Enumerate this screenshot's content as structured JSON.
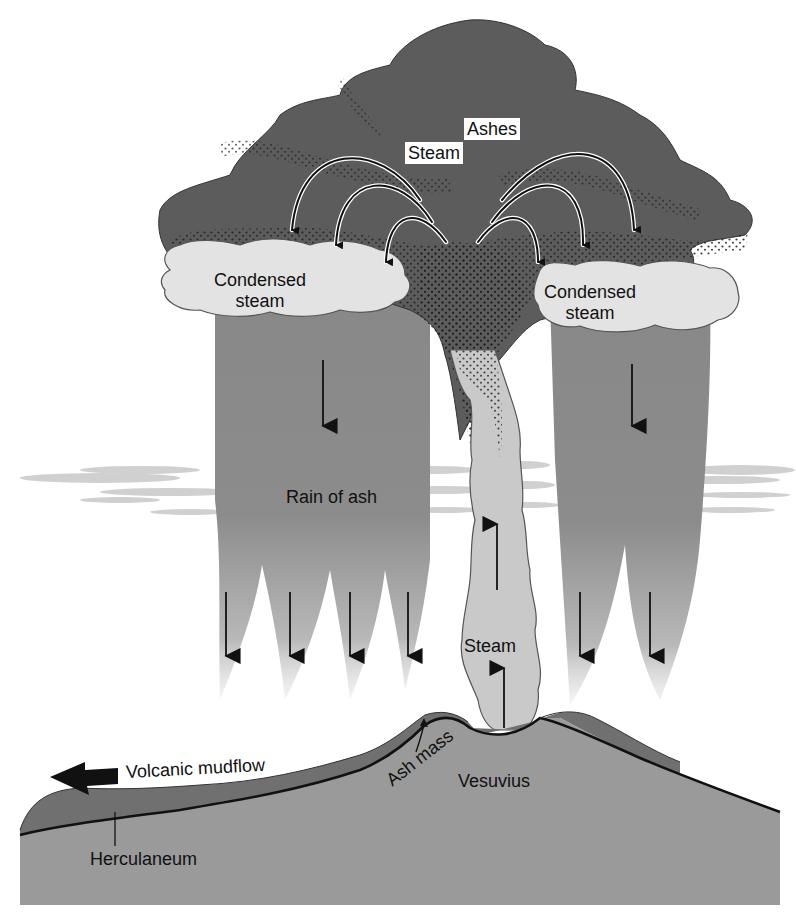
{
  "diagram": {
    "colors": {
      "ash_cloud": "#5c5c5c",
      "ash_dots": "#1e1e1e",
      "condensed_steam": "#e3e3e3",
      "rain_of_ash": "#8a8a8a",
      "steam_column": "#cfcfcf",
      "ground": "#9a9a9a",
      "ash_mass_layer": "#6e6e6e",
      "cirrus": "#c4c4c4",
      "outline": "#111111"
    },
    "labels": {
      "ashes": "Ashes",
      "steam_top": "Steam",
      "condensed_left": [
        "Condensed",
        "steam"
      ],
      "condensed_right": [
        "Condensed",
        "steam"
      ],
      "rain_of_ash": "Rain of ash",
      "steam_column": "Steam",
      "volcanic_mudflow": "Volcanic mudflow",
      "ash_mass": "Ash mass",
      "vesuvius": "Vesuvius",
      "herculaneum": "Herculaneum"
    },
    "arrows": {
      "cloud_arcs": 6,
      "rain_down_arrows": 8,
      "steam_up_arrows": 2,
      "mudflow_direction": "left"
    }
  }
}
